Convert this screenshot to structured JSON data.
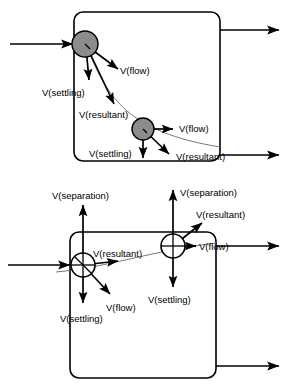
{
  "figure": {
    "title": "",
    "colors": {
      "particle_fill": "#8c8c8c",
      "particle_open_fill": "#ffffff",
      "stroke": "#000000",
      "trajectory": "#555555",
      "background": "#ffffff"
    },
    "panels": [
      {
        "id": "top-panel",
        "name": "horizontal-flow-settling-tank",
        "tank": {
          "x": 74,
          "y": 12,
          "width": 146,
          "height": 149,
          "corner_radius": 9
        },
        "pipes": [
          {
            "name": "inlet-pipe-top",
            "label": "",
            "x1": 10,
            "y1": 44,
            "x2": 76,
            "y2": 44,
            "arrow": "end"
          },
          {
            "name": "outlet-pipe-top-upper",
            "label": "",
            "x1": 220,
            "y1": 30,
            "x2": 281,
            "y2": 30,
            "arrow": "end"
          },
          {
            "name": "outlet-pipe-top-lower",
            "label": "",
            "x1": 220,
            "y1": 155,
            "x2": 281,
            "y2": 155,
            "arrow": "end"
          }
        ],
        "particles": [
          {
            "name": "particle-1",
            "cx": 85,
            "cy": 44,
            "r": 13,
            "filled": true,
            "vectors": [
              {
                "name": "v-flow-vector",
                "label": "V(flow)",
                "x1": 85,
                "y1": 44,
                "x2": 120,
                "y2": 70,
                "label_x": 122,
                "label_y": 74
              },
              {
                "name": "v-settling-vector",
                "label": "V(settling)",
                "x1": 85,
                "y1": 44,
                "x2": 89,
                "y2": 83,
                "label_x": 43,
                "label_y": 95
              },
              {
                "name": "v-resultant-vector",
                "label": "V(resultant)",
                "x1": 85,
                "y1": 44,
                "x2": 116,
                "y2": 108,
                "label_x": 79,
                "label_y": 118
              }
            ]
          },
          {
            "name": "particle-2",
            "cx": 143,
            "cy": 129,
            "r": 11,
            "filled": true,
            "vectors": [
              {
                "name": "v-flow-vector",
                "label": "V(flow)",
                "x1": 143,
                "y1": 129,
                "x2": 175,
                "y2": 129,
                "label_x": 178,
                "label_y": 132
              },
              {
                "name": "v-settling-vector",
                "label": "V(settling)",
                "x1": 143,
                "y1": 129,
                "x2": 143,
                "y2": 160,
                "label_x": 90,
                "label_y": 157
              },
              {
                "name": "v-resultant-vector",
                "label": "V(resultant)",
                "x1": 143,
                "y1": 129,
                "x2": 172,
                "y2": 157,
                "label_x": 175,
                "label_y": 160
              }
            ]
          }
        ],
        "trajectory": {
          "name": "particle-path-top",
          "d": "M 85 44 C 105 95 125 130 220 146"
        }
      },
      {
        "id": "bottom-panel",
        "name": "flotation-separation-tank",
        "tank": {
          "x": 70,
          "y": 232,
          "width": 146,
          "height": 146,
          "corner_radius": 9
        },
        "pipes": [
          {
            "name": "inlet-pipe-bottom",
            "label": "",
            "x1": 8,
            "y1": 265,
            "x2": 72,
            "y2": 265,
            "arrow": "end"
          },
          {
            "name": "outlet-pipe-bottom-upper",
            "label": "",
            "x1": 216,
            "y1": 246,
            "x2": 281,
            "y2": 246,
            "arrow": "end"
          },
          {
            "name": "outlet-pipe-bottom-lower",
            "label": "",
            "x1": 216,
            "y1": 366,
            "x2": 281,
            "y2": 366,
            "arrow": "end"
          }
        ],
        "particles": [
          {
            "name": "particle-3",
            "cx": 83,
            "cy": 265,
            "r": 12,
            "filled": false,
            "vectors": [
              {
                "name": "v-separation-vector",
                "label": "V(separation)",
                "x1": 83,
                "y1": 265,
                "x2": 83,
                "y2": 203,
                "label_x": 55,
                "label_y": 199
              },
              {
                "name": "v-settling-vector",
                "label": "V(settling)",
                "x1": 83,
                "y1": 265,
                "x2": 83,
                "y2": 305,
                "label_x": 61,
                "label_y": 321
              },
              {
                "name": "v-flow-vector",
                "label": "V(flow)",
                "x1": 83,
                "y1": 265,
                "x2": 113,
                "y2": 297,
                "label_x": 105,
                "label_y": 310
              },
              {
                "name": "v-resultant-vector",
                "label": "V(resultant)",
                "x1": 83,
                "y1": 265,
                "x2": 120,
                "y2": 260,
                "label_x": 94,
                "label_y": 256
              }
            ]
          },
          {
            "name": "particle-4",
            "cx": 173,
            "cy": 246,
            "r": 12,
            "filled": false,
            "vectors": [
              {
                "name": "v-separation-vector",
                "label": "V(separation)",
                "x1": 173,
                "y1": 246,
                "x2": 173,
                "y2": 188,
                "label_x": 179,
                "label_y": 196
              },
              {
                "name": "v-settling-vector",
                "label": "V(settling)",
                "x1": 173,
                "y1": 246,
                "x2": 173,
                "y2": 289,
                "label_x": 150,
                "label_y": 302
              },
              {
                "name": "v-flow-vector",
                "label": "V(flow)",
                "x1": 173,
                "y1": 246,
                "x2": 198,
                "y2": 246,
                "label_x": 200,
                "label_y": 250
              },
              {
                "name": "v-resultant-vector",
                "label": "V(resultant)",
                "x1": 173,
                "y1": 246,
                "x2": 205,
                "y2": 221,
                "label_x": 197,
                "label_y": 217
              }
            ]
          }
        ],
        "trajectory": {
          "name": "particle-path-bottom",
          "d": "M 56 272 C 110 266 150 250 216 243"
        }
      }
    ],
    "labels": {
      "v_flow": "V(flow)",
      "v_settling": "V(settling)",
      "v_resultant": "V(resultant)",
      "v_separation": "V(separation)"
    }
  }
}
